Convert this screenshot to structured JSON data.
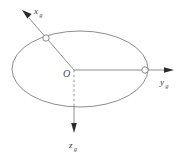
{
  "figure": {
    "type": "coordinate-frame-diagram",
    "background_color": "#ffffff",
    "stroke_color": "#6e6e6e",
    "text_color": "#3a3a3a",
    "origin": {
      "label": "O",
      "x": 74,
      "y": 70
    },
    "plane": {
      "name": "horizontal-plane-ellipse",
      "center_x": 80,
      "center_y": 69,
      "radius_x": 68,
      "radius_y": 38
    },
    "axes": [
      {
        "name": "x-axis",
        "label": "x",
        "subscript": "g",
        "direction": "up-left",
        "tip_x": 22,
        "tip_y": 12,
        "label_x": 33,
        "label_y": 12,
        "style": "solid",
        "arrow": true
      },
      {
        "name": "y-axis",
        "label": "y",
        "subscript": "g",
        "direction": "right",
        "tip_x": 174,
        "tip_y": 70,
        "label_x": 160,
        "label_y": 84,
        "style": "solid",
        "arrow": true
      },
      {
        "name": "z-axis",
        "label": "z",
        "subscript": "g",
        "direction": "down",
        "tip_x": 74,
        "tip_y": 131,
        "label_x": 70,
        "label_y": 147,
        "style": "dashed-inside-solid-outside",
        "arrow": true
      }
    ],
    "intersection_markers": [
      {
        "name": "x-axis-ellipse-intersection",
        "x": 46,
        "y": 38,
        "radius": 3.2
      },
      {
        "name": "y-axis-ellipse-intersection",
        "x": 145,
        "y": 70,
        "radius": 3.2
      }
    ]
  }
}
